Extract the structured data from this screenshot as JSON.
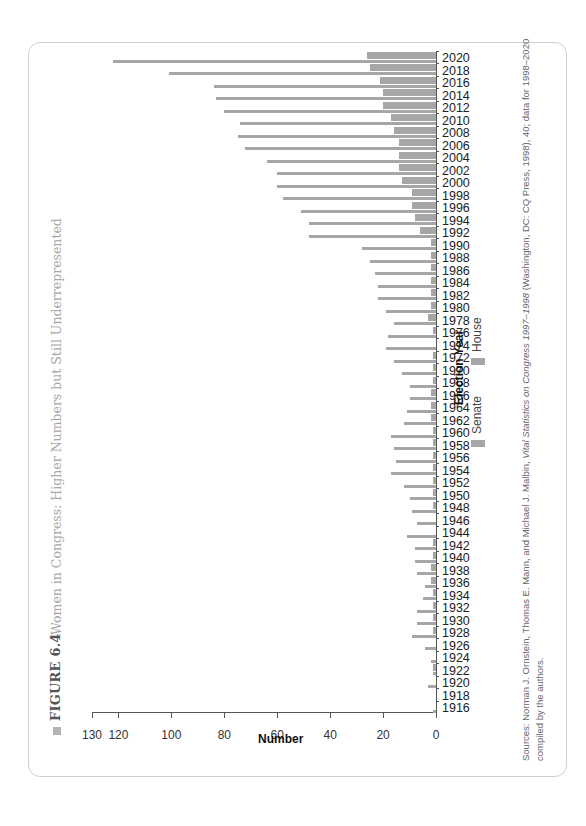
{
  "figure": {
    "label": "FIGURE 6.4",
    "title": "Women in Congress: Higher Numbers but Still Underrepresented"
  },
  "source": {
    "line1_prefix": "Sources: Norman J. Ornstein, Thomas E. Mann, and Michael J. Malbin, ",
    "line1_italic": "Vital Statistics on Congress 1997–1998",
    "line1_suffix": " (Washington, DC: CQ Press, 1998), 40; data for 1998–2020",
    "line2": "compiled by the authors."
  },
  "colors": {
    "bar": "#a6a6a6",
    "axis": "#555555",
    "frame": "#cfcfcf",
    "title": "#a8a8a8"
  },
  "chart_data": {
    "type": "bar",
    "orientation": "rotated 90° counter-clockwise (grouped columns rendered as leftward bars)",
    "title": "Women in Congress: Higher Numbers but Still Underrepresented",
    "xlabel": "Election Year",
    "ylabel": "Number",
    "ylim": [
      0,
      130
    ],
    "yticks": [
      0,
      20,
      40,
      60,
      80,
      100,
      120,
      130
    ],
    "grid": false,
    "legend": {
      "position": "below x-axis",
      "entries": [
        "Senate",
        "House"
      ]
    },
    "categories": [
      "1916",
      "1918",
      "1920",
      "1922",
      "1924",
      "1926",
      "1928",
      "1930",
      "1932",
      "1934",
      "1936",
      "1938",
      "1940",
      "1942",
      "1944",
      "1946",
      "1948",
      "1950",
      "1952",
      "1954",
      "1956",
      "1958",
      "1960",
      "1962",
      "1964",
      "1966",
      "1968",
      "1970",
      "1972",
      "1974",
      "1976",
      "1978",
      "1980",
      "1982",
      "1984",
      "1986",
      "1988",
      "1990",
      "1992",
      "1994",
      "1996",
      "1998",
      "2000",
      "2002",
      "2004",
      "2006",
      "2008",
      "2010",
      "2012",
      "2014",
      "2016",
      "2018",
      "2020"
    ],
    "series": [
      {
        "name": "Senate",
        "values": [
          0,
          0,
          0,
          1,
          0,
          0,
          1,
          1,
          1,
          1,
          2,
          2,
          1,
          1,
          0,
          0,
          1,
          1,
          1,
          1,
          1,
          1,
          1,
          2,
          2,
          2,
          1,
          1,
          1,
          0,
          1,
          3,
          2,
          2,
          2,
          2,
          2,
          2,
          6,
          8,
          9,
          9,
          13,
          14,
          14,
          14,
          16,
          17,
          20,
          20,
          21,
          25,
          26
        ]
      },
      {
        "name": "House",
        "values": [
          1,
          0,
          3,
          1,
          2,
          4,
          9,
          7,
          7,
          5,
          4,
          7,
          8,
          8,
          11,
          7,
          9,
          10,
          12,
          17,
          15,
          16,
          17,
          12,
          11,
          10,
          10,
          13,
          16,
          19,
          18,
          16,
          19,
          22,
          22,
          23,
          25,
          28,
          48,
          48,
          51,
          58,
          60,
          60,
          64,
          72,
          75,
          74,
          80,
          83,
          84,
          101,
          122
        ]
      }
    ]
  },
  "axis": {
    "value_title": "Number",
    "category_title": "Election Year",
    "value_ticks": [
      "130",
      "120",
      "100",
      "80",
      "60",
      "40",
      "20",
      "0"
    ]
  },
  "legend": {
    "senate_label": "Senate",
    "house_label": "House"
  }
}
